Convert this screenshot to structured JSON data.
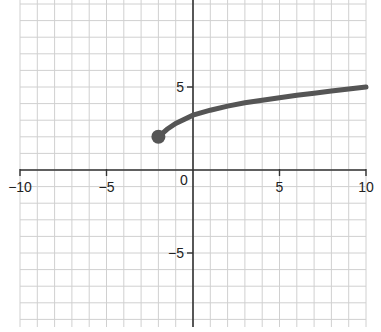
{
  "chart_data": {
    "type": "line",
    "title": "",
    "xlabel": "",
    "ylabel": "",
    "xlim": [
      -10,
      10
    ],
    "ylim": [
      -9.5,
      10
    ],
    "grid": true,
    "x_tick_labels": [
      "−10",
      "−5",
      "0",
      "5",
      "10"
    ],
    "y_tick_labels": [
      "5",
      "−5"
    ],
    "series": [
      {
        "name": "curve",
        "color": "#555555",
        "start_point": {
          "x": -2,
          "y": 2,
          "marker": "filled-circle"
        },
        "x": [
          -2,
          -1.5,
          -1,
          0,
          1,
          2,
          3,
          4,
          5,
          6,
          7,
          8,
          9,
          10
        ],
        "y": [
          2,
          2.45,
          2.8,
          3.3,
          3.6,
          3.85,
          4.05,
          4.2,
          4.35,
          4.5,
          4.62,
          4.75,
          4.88,
          5.0
        ]
      }
    ]
  }
}
